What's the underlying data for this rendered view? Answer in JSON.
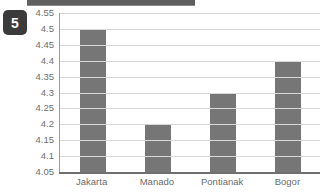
{
  "badge": {
    "label": "5"
  },
  "header_strip": {
    "present": true,
    "color": "#5f5f5f"
  },
  "chart_data": {
    "type": "bar",
    "title": "",
    "subtitle": "",
    "xlabel": "",
    "ylabel": "",
    "categories": [
      "Jakarta",
      "Manado",
      "Pontianak",
      "Bogor"
    ],
    "values": [
      4.5,
      4.2,
      4.3,
      4.4
    ],
    "ylim": [
      4.05,
      4.55
    ],
    "ytick_step": 0.05,
    "ytick_labels": [
      "4.55",
      "4.5",
      "4.45",
      "4.4",
      "4.35",
      "4.3",
      "4.25",
      "4.2",
      "4.15",
      "4.1",
      "4.05"
    ],
    "ytick_values": [
      4.55,
      4.5,
      4.45,
      4.4,
      4.35,
      4.3,
      4.25,
      4.2,
      4.15,
      4.1,
      4.05
    ],
    "grid": true,
    "grid_axis": "y",
    "legend": false,
    "legend_position": "none",
    "bar_color": "#767676",
    "grid_color": "#d8d8d8",
    "axis_color": "#6f6f6f",
    "background": "#ffffff",
    "note": "rightmost bar (Bogor) is clipped by the right edge of the image"
  }
}
